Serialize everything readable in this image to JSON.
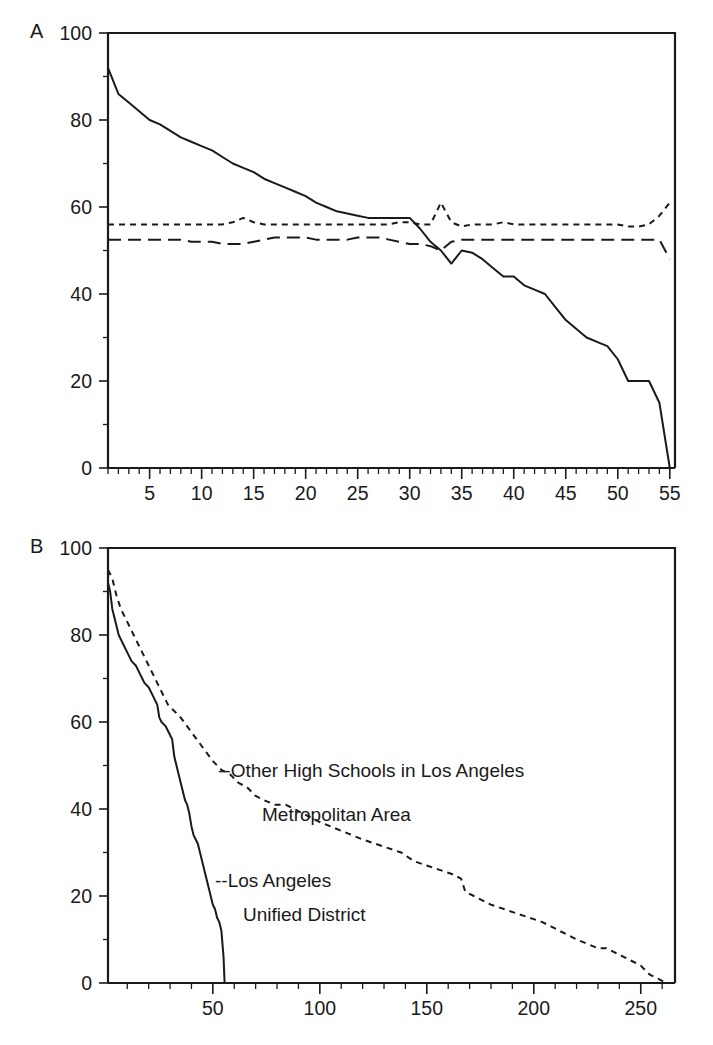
{
  "figure": {
    "panels": [
      {
        "id": "A",
        "letter": "A",
        "y_axis": {
          "labels": [
            "0",
            "20",
            "40",
            "60",
            "80",
            "100"
          ],
          "values": [
            0,
            20,
            40,
            60,
            80,
            100
          ],
          "min": 0,
          "max": 100,
          "minor_step": 10
        },
        "x_axis": {
          "labels": [
            "5",
            "10",
            "15",
            "20",
            "25",
            "30",
            "35",
            "40",
            "45",
            "50",
            "55"
          ],
          "values": [
            5,
            10,
            15,
            20,
            25,
            30,
            35,
            40,
            45,
            50,
            55
          ],
          "min": 1,
          "max": 55.5,
          "minor_step": 1
        }
      },
      {
        "id": "B",
        "letter": "B",
        "y_axis": {
          "labels": [
            "0",
            "20",
            "40",
            "60",
            "80",
            "100"
          ],
          "values": [
            0,
            20,
            40,
            60,
            80,
            100
          ],
          "min": 0,
          "max": 100,
          "minor_step": 10
        },
        "x_axis": {
          "labels": [
            "50",
            "100",
            "150",
            "200",
            "250"
          ],
          "values": [
            50,
            100,
            150,
            200,
            250
          ],
          "min": 1,
          "max": 266,
          "minor_step": 10
        },
        "annotations": [
          {
            "id": "other-schools",
            "line1": "--Other High Schools in Los Angeles",
            "line2": "Metropolitan Area"
          },
          {
            "id": "lausd",
            "line1": "--Los Angeles",
            "line2": "Unified District"
          }
        ]
      }
    ]
  },
  "chart_data": [
    {
      "type": "line",
      "panel": "A",
      "title": "",
      "xlabel": "",
      "ylabel": "",
      "xlim": [
        1,
        55.5
      ],
      "ylim": [
        0,
        100
      ],
      "grid": false,
      "legend": "none",
      "x": [
        1,
        2,
        3,
        4,
        5,
        6,
        7,
        8,
        9,
        10,
        11,
        12,
        13,
        14,
        15,
        16,
        17,
        18,
        19,
        20,
        21,
        22,
        23,
        24,
        25,
        26,
        27,
        28,
        29,
        30,
        31,
        32,
        33,
        34,
        35,
        36,
        37,
        38,
        39,
        40,
        41,
        42,
        43,
        44,
        45,
        46,
        47,
        48,
        49,
        50,
        51,
        52,
        53,
        54,
        55
      ],
      "series": [
        {
          "name": "solid-series",
          "style": "solid",
          "values": [
            92,
            86,
            84,
            82,
            80,
            79,
            77.5,
            76,
            75,
            74,
            73,
            71.5,
            70,
            69,
            68,
            66.5,
            65.5,
            64.5,
            63.5,
            62.5,
            61,
            60,
            59,
            58.5,
            58,
            57.5,
            57.5,
            57.5,
            57.5,
            57.5,
            55,
            52,
            50,
            47,
            50,
            49.5,
            48,
            46,
            44,
            44,
            42,
            41,
            40,
            37,
            34,
            32,
            30,
            29,
            28,
            25,
            20,
            20,
            20,
            15,
            0
          ]
        },
        {
          "name": "short-dash-series",
          "style": "short-dash",
          "values": [
            56,
            56,
            56,
            56,
            56,
            56,
            56,
            56,
            56,
            56,
            56,
            56,
            56.5,
            57.5,
            56.5,
            56,
            56,
            56,
            56,
            56,
            56,
            56,
            56,
            56,
            56,
            56,
            56,
            56,
            56.5,
            56.5,
            56,
            56,
            61,
            56.5,
            55.5,
            56,
            56,
            56,
            56.5,
            56,
            56,
            56,
            56,
            56,
            56,
            56,
            56,
            56,
            56,
            56,
            55.5,
            55.5,
            56,
            58,
            61
          ]
        },
        {
          "name": "long-dash-series",
          "style": "long-dash",
          "values": [
            52.5,
            52.5,
            52.5,
            52.5,
            52.5,
            52.5,
            52.5,
            52.5,
            52,
            52,
            52,
            51.5,
            51.5,
            51.5,
            52,
            52.5,
            53,
            53,
            53,
            53,
            52.5,
            52.5,
            52.5,
            52.5,
            53,
            53,
            53,
            52.5,
            52,
            51.5,
            51.5,
            51,
            50,
            52,
            52.5,
            52.5,
            52.5,
            52.5,
            52.5,
            52.5,
            52.5,
            52.5,
            52.5,
            52.5,
            52.5,
            52.5,
            52.5,
            52.5,
            52.5,
            52.5,
            52.5,
            52.5,
            52.5,
            52.5,
            48
          ]
        }
      ]
    },
    {
      "type": "line",
      "panel": "B",
      "title": "",
      "xlabel": "",
      "ylabel": "",
      "xlim": [
        1,
        266
      ],
      "ylim": [
        0,
        100
      ],
      "grid": false,
      "legend": "annotated-inline",
      "series": [
        {
          "name": "Los Angeles Unified District",
          "style": "solid",
          "points": [
            [
              1,
              92
            ],
            [
              2,
              90
            ],
            [
              3,
              86
            ],
            [
              4,
              84
            ],
            [
              5,
              82
            ],
            [
              6,
              80
            ],
            [
              7,
              79
            ],
            [
              8,
              78
            ],
            [
              10,
              76
            ],
            [
              12,
              74
            ],
            [
              14,
              73
            ],
            [
              16,
              71
            ],
            [
              17,
              70
            ],
            [
              18,
              69
            ],
            [
              20,
              68
            ],
            [
              22,
              66
            ],
            [
              24,
              64
            ],
            [
              25,
              61
            ],
            [
              26,
              60
            ],
            [
              28,
              59
            ],
            [
              29,
              58
            ],
            [
              30,
              57
            ],
            [
              31,
              56
            ],
            [
              32,
              52
            ],
            [
              33,
              50
            ],
            [
              34,
              48
            ],
            [
              35,
              46
            ],
            [
              36,
              44
            ],
            [
              37,
              42
            ],
            [
              38,
              41
            ],
            [
              39,
              39
            ],
            [
              40,
              36
            ],
            [
              41,
              34
            ],
            [
              42,
              33
            ],
            [
              43,
              32
            ],
            [
              44,
              30
            ],
            [
              45,
              28
            ],
            [
              46,
              26
            ],
            [
              47,
              24
            ],
            [
              48,
              22
            ],
            [
              49,
              20
            ],
            [
              50,
              18
            ],
            [
              51,
              17
            ],
            [
              52,
              15
            ],
            [
              53,
              14
            ],
            [
              54,
              12
            ],
            [
              55,
              6
            ],
            [
              55.5,
              0
            ]
          ]
        },
        {
          "name": "Other High Schools in Los Angeles Metropolitan Area",
          "style": "dash",
          "points": [
            [
              1,
              95
            ],
            [
              3,
              93
            ],
            [
              5,
              89
            ],
            [
              7,
              86
            ],
            [
              9,
              84
            ],
            [
              11,
              82
            ],
            [
              13,
              80
            ],
            [
              15,
              78
            ],
            [
              17,
              76
            ],
            [
              19,
              74
            ],
            [
              21,
              72
            ],
            [
              23,
              70
            ],
            [
              25,
              68
            ],
            [
              27,
              66
            ],
            [
              29,
              64
            ],
            [
              31,
              63
            ],
            [
              33,
              62
            ],
            [
              35,
              61
            ],
            [
              38,
              59
            ],
            [
              41,
              57
            ],
            [
              44,
              55
            ],
            [
              47,
              53
            ],
            [
              50,
              51
            ],
            [
              54,
              49
            ],
            [
              58,
              48
            ],
            [
              62,
              46
            ],
            [
              66,
              45
            ],
            [
              70,
              43
            ],
            [
              74,
              42
            ],
            [
              79,
              41
            ],
            [
              84,
              41
            ],
            [
              88,
              40
            ],
            [
              92,
              39
            ],
            [
              96,
              38
            ],
            [
              100,
              37
            ],
            [
              105,
              36
            ],
            [
              110,
              35
            ],
            [
              115,
              34
            ],
            [
              120,
              33
            ],
            [
              126,
              32
            ],
            [
              132,
              31
            ],
            [
              138,
              30
            ],
            [
              144,
              28
            ],
            [
              150,
              27
            ],
            [
              156,
              26
            ],
            [
              162,
              25
            ],
            [
              166,
              24
            ],
            [
              168,
              21
            ],
            [
              172,
              20
            ],
            [
              176,
              19
            ],
            [
              180,
              18
            ],
            [
              186,
              17
            ],
            [
              192,
              16
            ],
            [
              198,
              15
            ],
            [
              204,
              14
            ],
            [
              208,
              13
            ],
            [
              212,
              12
            ],
            [
              216,
              11
            ],
            [
              220,
              10
            ],
            [
              225,
              9
            ],
            [
              230,
              8
            ],
            [
              234,
              8
            ],
            [
              238,
              7
            ],
            [
              242,
              6
            ],
            [
              246,
              5
            ],
            [
              250,
              4
            ],
            [
              254,
              2
            ],
            [
              258,
              1
            ],
            [
              262,
              0
            ],
            [
              266,
              0
            ]
          ]
        }
      ]
    }
  ]
}
